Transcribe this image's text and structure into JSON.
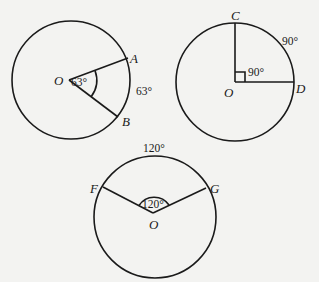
{
  "diagrams": [
    {
      "id": "circle-63",
      "center_label": "O",
      "points": [
        "A",
        "B"
      ],
      "central_angle_label": "63°",
      "arc_label": "63°"
    },
    {
      "id": "circle-90",
      "center_label": "O",
      "points": [
        "C",
        "D"
      ],
      "central_angle_label": "90°",
      "arc_label": "90°"
    },
    {
      "id": "circle-120",
      "center_label": "O",
      "points": [
        "F",
        "G"
      ],
      "central_angle_label": "120°",
      "arc_label": "120°"
    }
  ],
  "colors": {
    "background": "#f3f3f1",
    "ink": "#1a1a1a"
  }
}
